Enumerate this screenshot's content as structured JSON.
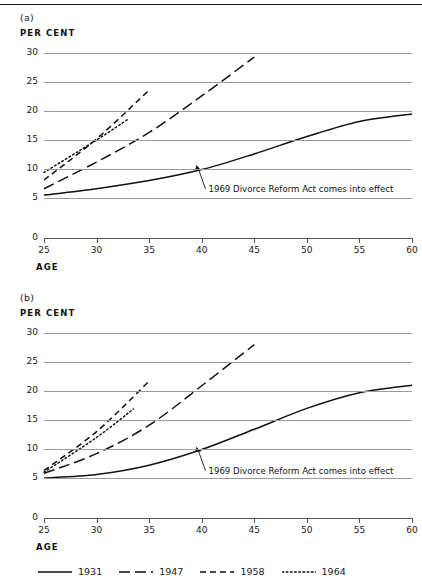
{
  "figure": {
    "panels": [
      {
        "label": "(a)",
        "y_axis_title": "PER CENT",
        "x_axis_title": "AGE",
        "annotation": "1969 Divorce Reform Act comes into effect"
      },
      {
        "label": "(b)",
        "y_axis_title": "PER CENT",
        "x_axis_title": "AGE",
        "annotation": "1969 Divorce Reform Act comes into effect"
      }
    ],
    "legend": [
      {
        "label": "1931",
        "style": "solid"
      },
      {
        "label": "1947",
        "style": "long-dash"
      },
      {
        "label": "1958",
        "style": "short-dash"
      },
      {
        "label": "1964",
        "style": "dotted"
      }
    ]
  },
  "chart_data": [
    {
      "type": "line",
      "title": "(a)",
      "xlabel": "AGE",
      "ylabel": "PER CENT",
      "xlim": [
        25,
        60
      ],
      "ylim": [
        0,
        30
      ],
      "xticks": [
        25,
        30,
        35,
        40,
        45,
        50,
        55,
        60
      ],
      "yticks": [
        0,
        5,
        10,
        15,
        20,
        25,
        30
      ],
      "grid": true,
      "axis_break_below": 5,
      "legend_position": "bottom",
      "annotations": [
        {
          "text": "1969 Divorce Reform Act comes into effect",
          "points_to_x": 39.5,
          "points_to_y": 10.7
        }
      ],
      "series": [
        {
          "name": "1931",
          "style": "solid",
          "x": [
            25,
            30,
            35,
            40,
            45,
            50,
            55,
            60
          ],
          "values": [
            5.5,
            6.6,
            8.0,
            9.9,
            12.6,
            15.6,
            18.2,
            19.5
          ]
        },
        {
          "name": "1947",
          "style": "long-dash",
          "x": [
            25,
            30,
            35,
            40,
            45
          ],
          "values": [
            6.6,
            11.2,
            16.3,
            22.6,
            29.3
          ]
        },
        {
          "name": "1958",
          "style": "short-dash",
          "x": [
            25,
            30,
            35
          ],
          "values": [
            8.1,
            15.2,
            23.6
          ]
        },
        {
          "name": "1964",
          "style": "dotted",
          "x": [
            25,
            30,
            33
          ],
          "values": [
            9.4,
            15.0,
            18.6
          ]
        }
      ]
    },
    {
      "type": "line",
      "title": "(b)",
      "xlabel": "AGE",
      "ylabel": "PER CENT",
      "xlim": [
        25,
        60
      ],
      "ylim": [
        0,
        30
      ],
      "xticks": [
        25,
        30,
        35,
        40,
        45,
        50,
        55,
        60
      ],
      "yticks": [
        0,
        5,
        10,
        15,
        20,
        25,
        30
      ],
      "grid": true,
      "axis_break_below": 5,
      "legend_position": "bottom",
      "annotations": [
        {
          "text": "1969 Divorce Reform Act comes into effect",
          "points_to_x": 39.5,
          "points_to_y": 10.4
        }
      ],
      "series": [
        {
          "name": "1931",
          "style": "solid",
          "x": [
            25,
            30,
            35,
            40,
            45,
            50,
            55,
            60
          ],
          "values": [
            5.0,
            5.6,
            7.2,
            9.9,
            13.4,
            17.0,
            19.7,
            21.0
          ]
        },
        {
          "name": "1947",
          "style": "long-dash",
          "x": [
            25,
            30,
            35,
            40,
            45
          ],
          "values": [
            5.8,
            9.2,
            14.1,
            20.9,
            28.0
          ]
        },
        {
          "name": "1958",
          "style": "short-dash",
          "x": [
            25,
            30,
            35
          ],
          "values": [
            6.3,
            13.0,
            21.7
          ]
        },
        {
          "name": "1964",
          "style": "dotted",
          "x": [
            25,
            30,
            33.5
          ],
          "values": [
            6.0,
            12.0,
            16.9
          ]
        }
      ]
    }
  ]
}
